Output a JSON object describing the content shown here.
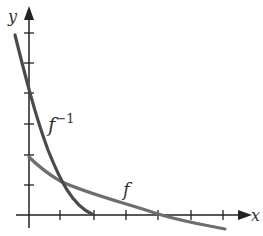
{
  "diagram": {
    "axes": {
      "x_label": "x",
      "y_label": "y"
    },
    "curves": [
      {
        "name": "f",
        "label": "f",
        "color": "#6e6e6e"
      },
      {
        "name": "f-inverse",
        "label": "f",
        "superscript": "−1",
        "color": "#4a4a4a"
      }
    ],
    "x_ticks": 6,
    "y_ticks": 6
  }
}
